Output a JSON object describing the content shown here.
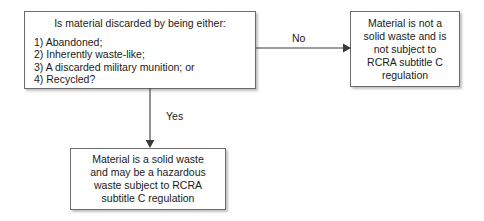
{
  "diagram": {
    "line_color": "#3a3a3a",
    "box_border_color": "#6b6b6b",
    "background": "#ffffff"
  },
  "nodes": {
    "question": {
      "title": "Is material discarded by being either:",
      "options": [
        "1) Abandoned;",
        "2) Inherently waste-like;",
        "3) A discarded military munition; or",
        "4) Recycled?"
      ]
    },
    "not_solid_waste": {
      "lines": [
        "Material is not a",
        "solid waste and is",
        "not subject to",
        "RCRA subtitle C",
        "regulation"
      ]
    },
    "is_solid_waste": {
      "lines": [
        "Material is a solid waste",
        "and may be a hazardous",
        "waste subject to RCRA",
        "subtitle C regulation"
      ]
    }
  },
  "edges": {
    "no_label": "No",
    "yes_label": "Yes"
  }
}
